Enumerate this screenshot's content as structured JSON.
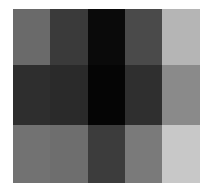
{
  "chart_data": {
    "type": "heatmap",
    "title": "",
    "xlabel": "",
    "ylabel": "",
    "rows": 3,
    "cols": 5,
    "colormap": "grayscale",
    "values": [
      [
        0.42,
        0.23,
        0.04,
        0.29,
        0.71
      ],
      [
        0.18,
        0.16,
        0.02,
        0.18,
        0.54
      ],
      [
        0.45,
        0.43,
        0.24,
        0.48,
        0.78
      ]
    ],
    "colors": [
      [
        "#6a6a6a",
        "#3a3a3a",
        "#0a0a0a",
        "#4a4a4a",
        "#b5b5b5"
      ],
      [
        "#2e2e2e",
        "#2a2a2a",
        "#050505",
        "#2f2f2f",
        "#8a8a8a"
      ],
      [
        "#727272",
        "#6e6e6e",
        "#3c3c3c",
        "#7a7a7a",
        "#c8c8c8"
      ]
    ],
    "grid": false,
    "legend": null
  }
}
